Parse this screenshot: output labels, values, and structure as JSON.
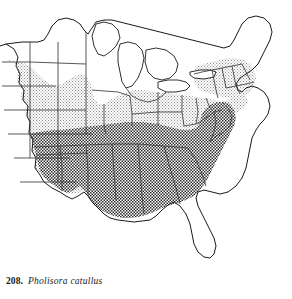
{
  "figure": {
    "number": "208.",
    "species_name": "Pholisora catullus",
    "map_title": "distribution-map-eastern-united-states"
  },
  "map": {
    "background_color": "#ffffff",
    "outline_color": "#1a1a1a",
    "state_border_color": "#3a3a3a",
    "shading": {
      "light_fill_color": "#b9b9b9",
      "dark_fill_color": "#6e6e6e"
    },
    "regions": [
      {
        "name": "northern-plains-light-range",
        "density": "light"
      },
      {
        "name": "great-lakes-light-range",
        "density": "light"
      },
      {
        "name": "northeast-light-range",
        "density": "light"
      },
      {
        "name": "southern-dark-range",
        "density": "dark"
      },
      {
        "name": "mid-atlantic-dark-range",
        "density": "dark"
      }
    ],
    "unshaded_areas": [
      "maine",
      "northern-new-england",
      "upper-michigan",
      "northern-wisconsin",
      "northern-minnesota",
      "great-lakes-water",
      "florida-peninsula",
      "southern-louisiana-coast"
    ]
  }
}
